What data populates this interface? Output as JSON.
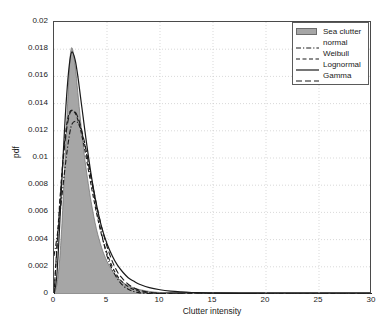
{
  "chart_data": {
    "type": "area",
    "title": "",
    "xlabel": "Clutter intensity",
    "ylabel": "pdf",
    "xlim": [
      0,
      30
    ],
    "ylim": [
      0,
      0.02
    ],
    "xticks": [
      0,
      5,
      10,
      15,
      20,
      25,
      30
    ],
    "xtick_labels": [
      "0",
      "5",
      "10",
      "15",
      "20",
      "25",
      "30"
    ],
    "yticks": [
      0,
      0.002,
      0.004,
      0.006,
      0.008,
      0.01,
      0.012,
      0.014,
      0.016,
      0.018,
      0.02
    ],
    "ytick_labels": [
      "0",
      "0.002",
      "0.004",
      "0.006",
      "0.008",
      "0.01",
      "0.012",
      "0.014",
      "0.016",
      "0.018",
      "0.02"
    ],
    "grid": true,
    "grid_style": "dotted",
    "grid_color": "#c8c8c8",
    "legend_position": "top-right",
    "legend": [
      {
        "label": "Sea clutter",
        "style": "filled-patch",
        "color": "#a6a6a6"
      },
      {
        "label": "normal",
        "style": "dash-dot",
        "color": "#1a1a1a"
      },
      {
        "label": "Weibull",
        "style": "dashed",
        "color": "#1a1a1a"
      },
      {
        "label": "Lognormal",
        "style": "solid",
        "color": "#1a1a1a"
      },
      {
        "label": "Gamma",
        "style": "long-dashed",
        "color": "#1a1a1a"
      }
    ],
    "x": [
      0,
      0.25,
      0.5,
      0.75,
      1,
      1.25,
      1.5,
      1.7,
      2,
      2.25,
      2.5,
      2.75,
      3,
      3.5,
      4,
      4.5,
      5,
      5.5,
      6,
      6.5,
      7,
      7.5,
      8,
      9,
      10,
      11,
      12,
      13,
      14,
      15,
      17.5,
      20,
      22.5,
      25,
      27.5,
      30
    ],
    "series": [
      {
        "name": "Sea clutter",
        "type": "histogram-area",
        "values": [
          0.0,
          0.0006,
          0.0022,
          0.0052,
          0.0092,
          0.0135,
          0.0172,
          0.0181,
          0.0168,
          0.0148,
          0.0128,
          0.011,
          0.0094,
          0.0068,
          0.0048,
          0.0034,
          0.0024,
          0.0017,
          0.0012,
          0.00085,
          0.00062,
          0.00046,
          0.00034,
          0.00019,
          0.00011,
          7e-05,
          4e-05,
          2.5e-05,
          1.5e-05,
          1e-05,
          4e-06,
          2e-06,
          1e-06,
          5e-07,
          3e-07,
          0.0
        ]
      },
      {
        "name": "normal",
        "type": "line",
        "values": [
          0.0028,
          0.004,
          0.0055,
          0.0072,
          0.009,
          0.0106,
          0.0119,
          0.0125,
          0.0127,
          0.0126,
          0.0122,
          0.0115,
          0.0106,
          0.0085,
          0.0063,
          0.0044,
          0.0028,
          0.0018,
          0.0011,
          0.00063,
          0.00035,
          0.00019,
          0.0001,
          3e-05,
          1e-05,
          3e-06,
          1e-06,
          5e-07,
          2e-07,
          1e-07,
          0.0,
          0.0,
          0.0,
          0.0,
          0.0,
          0.0
        ]
      },
      {
        "name": "Weibull",
        "type": "line",
        "values": [
          0.0,
          0.0032,
          0.0063,
          0.009,
          0.0112,
          0.0127,
          0.0134,
          0.0135,
          0.0133,
          0.0128,
          0.0121,
          0.0112,
          0.0102,
          0.008,
          0.006,
          0.0043,
          0.003,
          0.002,
          0.0013,
          0.00085,
          0.00054,
          0.00034,
          0.00021,
          8e-05,
          3e-05,
          1e-05,
          4e-06,
          2e-06,
          1e-06,
          4e-07,
          0.0,
          0.0,
          0.0,
          0.0,
          0.0,
          0.0
        ]
      },
      {
        "name": "Lognormal",
        "type": "line",
        "values": [
          0.0,
          0.0012,
          0.0045,
          0.0085,
          0.0122,
          0.0152,
          0.0172,
          0.0178,
          0.0172,
          0.016,
          0.0145,
          0.013,
          0.0115,
          0.0088,
          0.0066,
          0.0049,
          0.0037,
          0.0028,
          0.0021,
          0.0016,
          0.0012,
          0.00095,
          0.00074,
          0.00047,
          0.00031,
          0.00021,
          0.00015,
          0.00011,
          8e-05,
          6e-05,
          3e-05,
          2e-05,
          1e-05,
          7e-06,
          5e-06,
          4e-06
        ]
      },
      {
        "name": "Gamma",
        "type": "line",
        "values": [
          0.0,
          0.003,
          0.006,
          0.0087,
          0.0109,
          0.0124,
          0.0133,
          0.0135,
          0.0134,
          0.013,
          0.0124,
          0.0116,
          0.0107,
          0.0086,
          0.0066,
          0.0049,
          0.0035,
          0.0024,
          0.0016,
          0.0011,
          0.00072,
          0.00047,
          0.0003,
          0.00012,
          5e-05,
          2e-05,
          8e-06,
          3e-06,
          1e-06,
          5e-07,
          0.0,
          0.0,
          0.0,
          0.0,
          0.0,
          0.0
        ]
      }
    ]
  },
  "axes": {
    "x_title": "Clutter intensity",
    "y_title": "pdf"
  }
}
